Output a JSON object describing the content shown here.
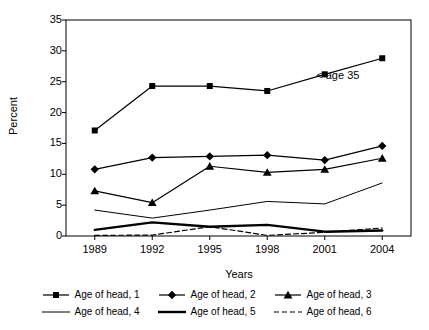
{
  "chart_data": {
    "type": "line",
    "title": "",
    "xlabel": "Years",
    "ylabel": "Percent",
    "categories": [
      "1989",
      "1992",
      "1995",
      "1998",
      "2001",
      "2004"
    ],
    "xticklabels": [
      "1989",
      "1992",
      "1995",
      "1998",
      "2001",
      "2004"
    ],
    "yticklabels": [
      "0",
      "5",
      "10",
      "15",
      "20",
      "25",
      "30",
      "35"
    ],
    "ylim": [
      0,
      35
    ],
    "ytick_step": 5,
    "grid": false,
    "legend_position": "bottom",
    "annotations": [
      {
        "text": "< age 35",
        "x": "2004",
        "y": 26.0
      }
    ],
    "series": [
      {
        "name": "Age of head, 1",
        "marker": "square",
        "line": "solid",
        "width": 1.2,
        "color": "#000000",
        "values": [
          17.1,
          24.3,
          24.3,
          23.5,
          26.2,
          28.8
        ]
      },
      {
        "name": "Age of head, 2",
        "marker": "diamond",
        "line": "solid",
        "width": 1.2,
        "color": "#000000",
        "values": [
          10.8,
          12.7,
          12.9,
          13.1,
          12.3,
          14.6
        ]
      },
      {
        "name": "Age of head, 3",
        "marker": "triangle",
        "line": "solid",
        "width": 1.2,
        "color": "#000000",
        "values": [
          7.3,
          5.4,
          11.3,
          10.3,
          10.8,
          12.6
        ]
      },
      {
        "name": "Age of head, 4",
        "marker": "none",
        "line": "solid",
        "width": 1.0,
        "color": "#000000",
        "values": [
          4.2,
          2.9,
          4.2,
          5.6,
          5.2,
          8.6
        ]
      },
      {
        "name": "Age of head, 5",
        "marker": "none",
        "line": "solid",
        "width": 2.4,
        "color": "#000000",
        "values": [
          1.0,
          2.2,
          1.5,
          1.8,
          0.7,
          0.9
        ]
      },
      {
        "name": "Age of head, 6",
        "marker": "none",
        "line": "dashed",
        "width": 1.2,
        "color": "#000000",
        "values": [
          0.1,
          0.15,
          1.5,
          0.1,
          0.6,
          1.3
        ]
      }
    ]
  },
  "legend": {
    "items": [
      {
        "label": "Age of head, 1"
      },
      {
        "label": "Age of head, 2"
      },
      {
        "label": "Age of head, 3"
      },
      {
        "label": "Age of head, 4"
      },
      {
        "label": "Age of head, 5"
      },
      {
        "label": "Age of head, 6"
      }
    ]
  }
}
